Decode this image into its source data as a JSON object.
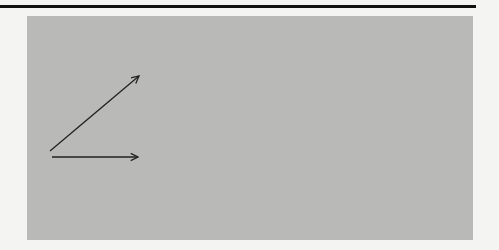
{
  "colors": {
    "background": "#f4f4f2",
    "panel": "#b9b9b7",
    "ink": "#222222",
    "rule": "#111111"
  },
  "nodes": [
    {
      "id": "1",
      "label": "1",
      "x": 43,
      "y": 157
    },
    {
      "id": "2",
      "label": "2",
      "x": 148,
      "y": 157
    },
    {
      "id": "3",
      "label": "3",
      "x": 148,
      "y": 72
    },
    {
      "id": "4",
      "label": "4",
      "x": 70,
      "y": 177
    },
    {
      "id": "5",
      "label": "5",
      "x": 255,
      "y": 157
    },
    {
      "id": "6",
      "label": "6",
      "x": 357,
      "y": 157
    },
    {
      "id": "7",
      "label": "7",
      "x": 457,
      "y": 157
    }
  ],
  "edges": [
    {
      "id": "A",
      "from": "1",
      "to": "2",
      "activity": "A",
      "duration": "7",
      "style": "solid"
    },
    {
      "id": "B",
      "from": "1",
      "to": "3",
      "activity": "B",
      "duration": "6",
      "style": "solid"
    },
    {
      "id": "C",
      "from": "1",
      "to": "4",
      "activity": "C",
      "duration": "2",
      "style": "solid"
    },
    {
      "id": "D",
      "from": "2",
      "to": "5",
      "activity": "D",
      "duration": "3",
      "style": "solid"
    },
    {
      "id": "E",
      "from": "3",
      "to": "5",
      "activity": "E",
      "duration": "5",
      "style": "solid"
    },
    {
      "id": "F",
      "from": "5",
      "to": "6",
      "activity": "F",
      "duration": "4",
      "style": "solid"
    },
    {
      "id": "G",
      "from": "4",
      "to": "6",
      "activity": "G",
      "duration": "0",
      "style": "dashed"
    },
    {
      "id": "H",
      "from": "6",
      "to": "7",
      "activity": "H",
      "duration": "5",
      "style": "solid"
    },
    {
      "id": "I",
      "from": "4",
      "to": "7",
      "activity": "I",
      "duration": "15",
      "style": "solid"
    }
  ]
}
